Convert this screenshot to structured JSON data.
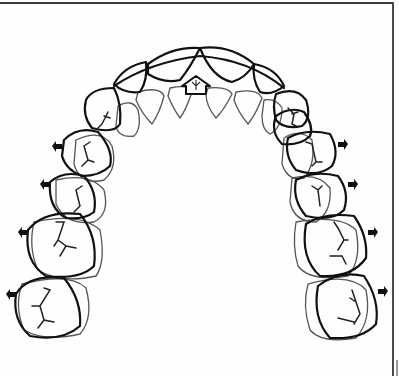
{
  "figure": {
    "type": "dental-arch-diagram",
    "description": "Occlusal view of upper dental arch with expansion arrows",
    "colors": {
      "line_bold": "#111111",
      "line_thin": "#555555",
      "background": "#ffffff",
      "frame": "#3a3a3a"
    },
    "arrows": {
      "anterior": {
        "direction": "up",
        "style": "outline",
        "icon": "arrow-up-outline-icon"
      },
      "lateral_left": {
        "count": 4,
        "direction": "left",
        "style": "solid",
        "icon": "arrow-left-icon"
      },
      "lateral_right": {
        "count": 4,
        "direction": "right",
        "style": "solid",
        "icon": "arrow-right-icon"
      }
    },
    "teeth": {
      "incisors": 4,
      "canines": 2,
      "premolars": 4,
      "molars": 4
    }
  }
}
